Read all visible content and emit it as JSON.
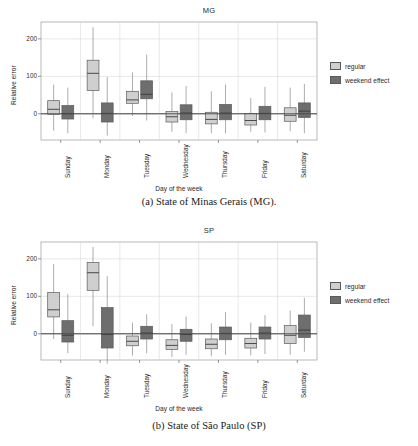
{
  "figures": [
    {
      "id": "mg",
      "caption": "(a) State of Minas Gerais (MG).",
      "chart_data": {
        "type": "box",
        "title": "MG",
        "xlabel": "Day of the week",
        "ylabel": "Relative error",
        "categories": [
          "Sunday",
          "Monday",
          "Tuesday",
          "Wednesday",
          "Thursday",
          "Friday",
          "Saturday"
        ],
        "yticks": [
          0,
          100,
          200
        ],
        "ylim": [
          -70,
          245
        ],
        "grid": true,
        "legend_position": "right",
        "series": [
          {
            "name": "regular",
            "color": "#cfcfcf",
            "boxes": [
              {
                "category": "Sunday",
                "whisker_low": -45,
                "q1": -2,
                "median": 12,
                "q3": 35,
                "whisker_high": 78
              },
              {
                "category": "Monday",
                "whisker_low": -12,
                "q1": 62,
                "median": 108,
                "q3": 143,
                "whisker_high": 231
              },
              {
                "category": "Tuesday",
                "whisker_low": -6,
                "q1": 28,
                "median": 37,
                "q3": 60,
                "whisker_high": 110
              },
              {
                "category": "Wednesday",
                "whisker_low": -48,
                "q1": -22,
                "median": -8,
                "q3": 6,
                "whisker_high": 57
              },
              {
                "category": "Thursday",
                "whisker_low": -52,
                "q1": -27,
                "median": -15,
                "q3": 4,
                "whisker_high": 60
              },
              {
                "category": "Friday",
                "whisker_low": -48,
                "q1": -30,
                "median": -18,
                "q3": 1,
                "whisker_high": 42
              },
              {
                "category": "Saturday",
                "whisker_low": -47,
                "q1": -20,
                "median": -4,
                "q3": 16,
                "whisker_high": 70
              }
            ]
          },
          {
            "name": "weekend effect",
            "color": "#6e6e6e",
            "boxes": [
              {
                "category": "Sunday",
                "whisker_low": -52,
                "q1": -14,
                "median": 0,
                "q3": 22,
                "whisker_high": 70
              },
              {
                "category": "Monday",
                "whisker_low": -58,
                "q1": -22,
                "median": 1,
                "q3": 29,
                "whisker_high": 98
              },
              {
                "category": "Tuesday",
                "whisker_low": -18,
                "q1": 40,
                "median": 52,
                "q3": 88,
                "whisker_high": 158
              },
              {
                "category": "Wednesday",
                "whisker_low": -52,
                "q1": -16,
                "median": 2,
                "q3": 24,
                "whisker_high": 74
              },
              {
                "category": "Thursday",
                "whisker_low": -52,
                "q1": -16,
                "median": 2,
                "q3": 25,
                "whisker_high": 78
              },
              {
                "category": "Friday",
                "whisker_low": -50,
                "q1": -16,
                "median": 1,
                "q3": 20,
                "whisker_high": 72
              },
              {
                "category": "Saturday",
                "whisker_low": -52,
                "q1": -10,
                "median": 7,
                "q3": 29,
                "whisker_high": 80
              }
            ]
          }
        ]
      }
    },
    {
      "id": "sp",
      "caption": "(b) State of São Paulo (SP)",
      "chart_data": {
        "type": "box",
        "title": "SP",
        "xlabel": "Day of the week",
        "ylabel": "Relative error",
        "categories": [
          "Sunday",
          "Monday",
          "Tuesday",
          "Wednesday",
          "Thursday",
          "Friday",
          "Saturday"
        ],
        "yticks": [
          0,
          100,
          200
        ],
        "ylim": [
          -70,
          245
        ],
        "grid": true,
        "legend_position": "right",
        "series": [
          {
            "name": "regular",
            "color": "#cfcfcf",
            "boxes": [
              {
                "category": "Sunday",
                "whisker_low": -14,
                "q1": 45,
                "median": 64,
                "q3": 110,
                "whisker_high": 186
              },
              {
                "category": "Monday",
                "whisker_low": 20,
                "q1": 116,
                "median": 163,
                "q3": 190,
                "whisker_high": 232
              },
              {
                "category": "Tuesday",
                "whisker_low": -58,
                "q1": -32,
                "median": -20,
                "q3": -6,
                "whisker_high": 30
              },
              {
                "category": "Wednesday",
                "whisker_low": -62,
                "q1": -42,
                "median": -31,
                "q3": -16,
                "whisker_high": 26
              },
              {
                "category": "Thursday",
                "whisker_low": -60,
                "q1": -40,
                "median": -28,
                "q3": -14,
                "whisker_high": 28
              },
              {
                "category": "Friday",
                "whisker_low": -58,
                "q1": -38,
                "median": -26,
                "q3": -12,
                "whisker_high": 30
              },
              {
                "category": "Saturday",
                "whisker_low": -56,
                "q1": -26,
                "median": -4,
                "q3": 22,
                "whisker_high": 62
              }
            ]
          },
          {
            "name": "weekend effect",
            "color": "#6e6e6e",
            "boxes": [
              {
                "category": "Sunday",
                "whisker_low": -52,
                "q1": -22,
                "median": -4,
                "q3": 35,
                "whisker_high": 106
              },
              {
                "category": "Monday",
                "whisker_low": -80,
                "q1": -38,
                "median": -2,
                "q3": 70,
                "whisker_high": 154
              },
              {
                "category": "Tuesday",
                "whisker_low": -52,
                "q1": -14,
                "median": 2,
                "q3": 20,
                "whisker_high": 52
              },
              {
                "category": "Wednesday",
                "whisker_low": -56,
                "q1": -20,
                "median": -2,
                "q3": 12,
                "whisker_high": 46
              },
              {
                "category": "Thursday",
                "whisker_low": -56,
                "q1": -16,
                "median": 1,
                "q3": 18,
                "whisker_high": 58
              },
              {
                "category": "Friday",
                "whisker_low": -54,
                "q1": -14,
                "median": 2,
                "q3": 18,
                "whisker_high": 50
              },
              {
                "category": "Saturday",
                "whisker_low": -48,
                "q1": -10,
                "median": 10,
                "q3": 50,
                "whisker_high": 96
              }
            ]
          }
        ]
      }
    }
  ]
}
